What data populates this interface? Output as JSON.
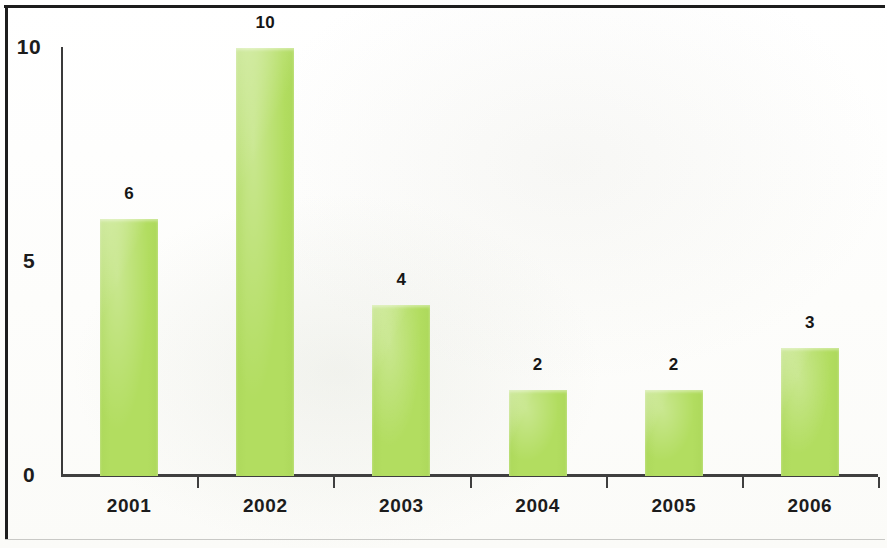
{
  "chart_data": {
    "type": "bar",
    "title": "",
    "subtitle": "",
    "xlabel": "",
    "ylabel": "",
    "categories": [
      "2001",
      "2002",
      "2003",
      "2004",
      "2005",
      "2006"
    ],
    "values": [
      6,
      10,
      4,
      2,
      2,
      3
    ],
    "data_labels": [
      "6",
      "10",
      "4",
      "2",
      "2",
      "3"
    ],
    "ylim": [
      0,
      10
    ],
    "ytick_labels": [
      "10",
      "5",
      "0"
    ],
    "ytick_values": [
      10,
      5,
      0
    ],
    "grid": false,
    "legend": false,
    "legend_position": "none",
    "bar_color": "#b2dd60",
    "axis_color": "#3f3f3f",
    "label_color": "#1c1c1c",
    "frame_color": "#1d1d1d"
  }
}
